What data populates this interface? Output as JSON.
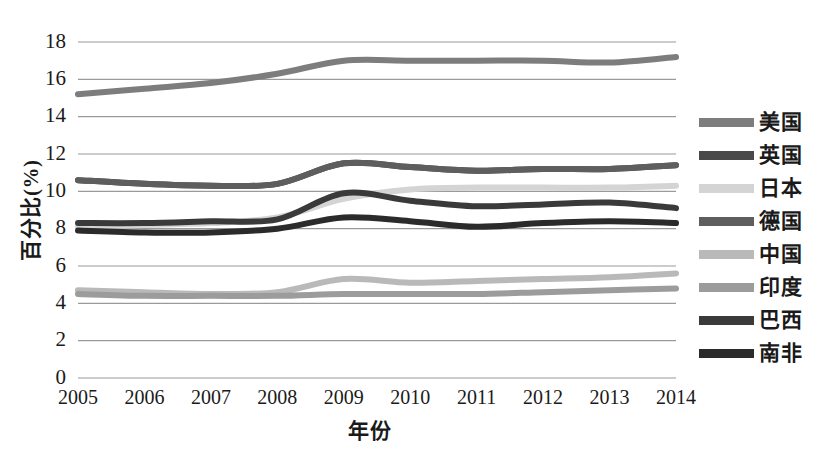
{
  "chart_data": {
    "type": "line",
    "title": "",
    "xlabel": "年份",
    "ylabel": "百分比(%)",
    "x": [
      "2005",
      "2006",
      "2007",
      "2008",
      "2009",
      "2010",
      "2011",
      "2012",
      "2013",
      "2014"
    ],
    "xlim": [
      2005,
      2014
    ],
    "ylim": [
      0,
      18
    ],
    "yticks": [
      "0",
      "2",
      "4",
      "6",
      "8",
      "10",
      "12",
      "14",
      "16",
      "18"
    ],
    "ytick_values": [
      0,
      2,
      4,
      6,
      8,
      10,
      12,
      14,
      16,
      18
    ],
    "grid": "horizontal",
    "legend_position": "right",
    "series": [
      {
        "name": "美国",
        "color": "#7d7d7d",
        "values": [
          15.2,
          15.5,
          15.8,
          16.3,
          17.0,
          17.0,
          17.0,
          17.0,
          16.9,
          17.2
        ]
      },
      {
        "name": "英国",
        "color": "#4a4a4a",
        "values": [
          10.6,
          10.4,
          10.3,
          10.4,
          11.5,
          11.3,
          11.1,
          11.2,
          11.2,
          11.4
        ]
      },
      {
        "name": "日本",
        "color": "#d4d4d4",
        "values": [
          8.1,
          8.2,
          8.3,
          8.6,
          9.6,
          10.1,
          10.2,
          10.2,
          10.2,
          10.3
        ]
      },
      {
        "name": "德国",
        "color": "#5e5e5e",
        "values": [
          10.6,
          10.4,
          10.3,
          10.4,
          11.5,
          11.3,
          11.1,
          11.2,
          11.2,
          11.4
        ]
      },
      {
        "name": "中国",
        "color": "#b9b9b9",
        "values": [
          4.7,
          4.6,
          4.5,
          4.6,
          5.3,
          5.1,
          5.2,
          5.3,
          5.4,
          5.6
        ]
      },
      {
        "name": "印度",
        "color": "#9c9c9c",
        "values": [
          4.5,
          4.4,
          4.4,
          4.4,
          4.5,
          4.5,
          4.5,
          4.6,
          4.7,
          4.8
        ]
      },
      {
        "name": "巴西",
        "color": "#3a3a3a",
        "values": [
          8.3,
          8.3,
          8.4,
          8.5,
          9.9,
          9.5,
          9.2,
          9.3,
          9.4,
          9.1
        ]
      },
      {
        "name": "南非",
        "color": "#2b2b2b",
        "values": [
          7.9,
          7.8,
          7.8,
          8.0,
          8.6,
          8.4,
          8.1,
          8.3,
          8.4,
          8.3
        ]
      }
    ]
  },
  "legend": {
    "items": [
      {
        "label": "美国",
        "color": "#7d7d7d"
      },
      {
        "label": "英国",
        "color": "#4a4a4a"
      },
      {
        "label": "日本",
        "color": "#d4d4d4"
      },
      {
        "label": "德国",
        "color": "#5e5e5e"
      },
      {
        "label": "中国",
        "color": "#b9b9b9"
      },
      {
        "label": "印度",
        "color": "#9c9c9c"
      },
      {
        "label": "巴西",
        "color": "#3a3a3a"
      },
      {
        "label": "南非",
        "color": "#2b2b2b"
      }
    ]
  }
}
